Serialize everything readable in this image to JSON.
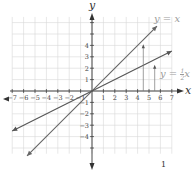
{
  "chart_data": {
    "type": "line",
    "title": "",
    "xlabel": "x",
    "ylabel": "y",
    "xlim": [
      -7,
      7
    ],
    "ylim": [
      -5.5,
      6.5
    ],
    "grid": true,
    "x_ticks": [
      -7,
      -6,
      -5,
      -4,
      -3,
      -2,
      -1,
      1,
      2,
      3,
      4,
      5,
      6,
      7
    ],
    "x_tick_labels": [
      "−7",
      "−6",
      "−5",
      "−4",
      "−3",
      "−2",
      "−1",
      "1",
      "2",
      "3",
      "4",
      "5",
      "6",
      "7"
    ],
    "y_ticks": [
      -4,
      -3,
      -2,
      -1,
      1,
      2,
      3,
      4
    ],
    "y_tick_labels": [
      "−4",
      "−3",
      "−2",
      "−1",
      "1",
      "2",
      "3",
      "4"
    ],
    "series": [
      {
        "name": "y = x",
        "slope": 1,
        "x": [
          -5.7,
          5.7
        ],
        "y": [
          -5.7,
          5.7
        ],
        "color": "#666666"
      },
      {
        "name": "y = ½x",
        "slope": 0.5,
        "x": [
          -7,
          7
        ],
        "y": [
          -3.5,
          3.5
        ],
        "color": "#555555"
      }
    ],
    "annotations": [
      {
        "type": "vertical-arrow",
        "x": 4.5,
        "from_y": 0,
        "to_y": 4.1
      },
      {
        "type": "vertical-arrow",
        "x": 5.5,
        "from_y": 0,
        "to_y": 2.3
      },
      {
        "type": "label",
        "text": "y = x",
        "near": [
          5.7,
          6.5
        ]
      },
      {
        "type": "label",
        "text": "y = ½x",
        "near": [
          6.2,
          1.7
        ]
      }
    ]
  },
  "labels": {
    "x_axis": "x",
    "y_axis": "y",
    "eq1": "y = x",
    "eq2_prefix": "y = ",
    "eq2_num": "1",
    "eq2_den": "2",
    "eq2_suffix": "x",
    "footer": "1"
  }
}
